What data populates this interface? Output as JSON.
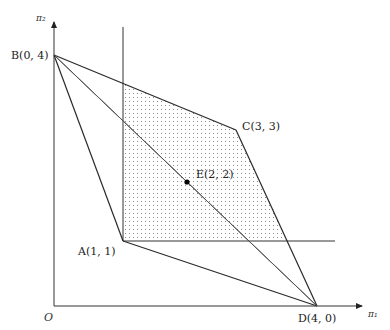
{
  "figure": {
    "axes": {
      "x_label": "π₁",
      "y_label": "π₂",
      "origin_label": "O"
    },
    "points": [
      {
        "id": "B",
        "label": "B(0, 4)",
        "x": 0,
        "y": 4
      },
      {
        "id": "C",
        "label": "C(3, 3)",
        "x": 3,
        "y": 3
      },
      {
        "id": "E",
        "label": "E(2, 2)",
        "x": 2,
        "y": 2
      },
      {
        "id": "A",
        "label": "A(1, 1)",
        "x": 1,
        "y": 1
      },
      {
        "id": "D",
        "label": "D(4, 0)",
        "x": 4,
        "y": 0
      }
    ],
    "segments": [
      "B-C",
      "C-D",
      "B-A",
      "A-D",
      "B-D",
      "B-E-D (diagonal through E)"
    ],
    "reference_lines": [
      {
        "type": "vertical",
        "at": "π₁ = 1"
      },
      {
        "type": "horizontal",
        "at": "π₂ = 1"
      }
    ],
    "shaded_region": "dotted region bounded by π₁ ≥ 1, π₂ ≥ 1 and the polygon B-C-D",
    "colors": {
      "line": "#2a2a2a",
      "thin_line": "#555555",
      "dots": "#888888",
      "point_fill": "#000000"
    }
  }
}
